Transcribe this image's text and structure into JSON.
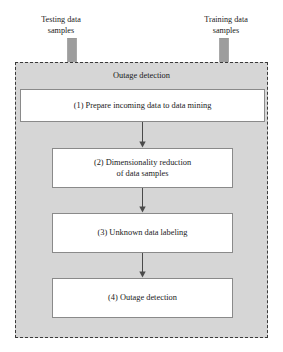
{
  "inputs": [
    {
      "id": "testing",
      "label": "Testing data\nsamples",
      "arrow_name": "input-arrow-testing"
    },
    {
      "id": "training",
      "label": "Training data\nsamples",
      "arrow_name": "input-arrow-training"
    }
  ],
  "input_labels": {
    "testing": "Testing data samples",
    "training": "Training data samples"
  },
  "container": {
    "title": "Outage detection"
  },
  "steps": [
    {
      "number": "(1)",
      "text": "(1) Prepare incoming data to data mining"
    },
    {
      "number": "(2)",
      "text": "(2) Dimensionality reduction of data samples"
    },
    {
      "number": "(3)",
      "text": "(3) Unknown data labeling"
    },
    {
      "number": "(4)",
      "text": "(4) Outage detection"
    }
  ],
  "step_lines": {
    "step2_line1": "(2) Dimensionality reduction",
    "step2_line2": "of data samples"
  },
  "colors": {
    "container_fill": "#d6d6d6",
    "container_border": "#3a3a3a",
    "box_fill": "#ffffff",
    "box_border": "#8a8a8a",
    "block_arrow": "#9d9d9d",
    "connector": "#4a4a4a",
    "text": "#1a1a1a",
    "page_background": "#ffffff"
  }
}
